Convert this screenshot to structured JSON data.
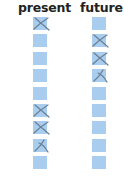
{
  "columns": [
    {
      "id": "present",
      "label": "present",
      "boxes": [
        {
          "mark": "x"
        },
        {
          "mark": "none"
        },
        {
          "mark": "none"
        },
        {
          "mark": "none"
        },
        {
          "mark": "none"
        },
        {
          "mark": "x"
        },
        {
          "mark": "x"
        },
        {
          "mark": "x-partial"
        },
        {
          "mark": "none"
        }
      ]
    },
    {
      "id": "future",
      "label": "future",
      "boxes": [
        {
          "mark": "none"
        },
        {
          "mark": "x"
        },
        {
          "mark": "x"
        },
        {
          "mark": "x-partial"
        },
        {
          "mark": "none"
        },
        {
          "mark": "none"
        },
        {
          "mark": "none"
        },
        {
          "mark": "none"
        },
        {
          "mark": "none"
        }
      ]
    }
  ],
  "colors": {
    "box_fill": "#a9cdee",
    "mark_stroke": "#6a7f93",
    "header_text": "#222222"
  }
}
